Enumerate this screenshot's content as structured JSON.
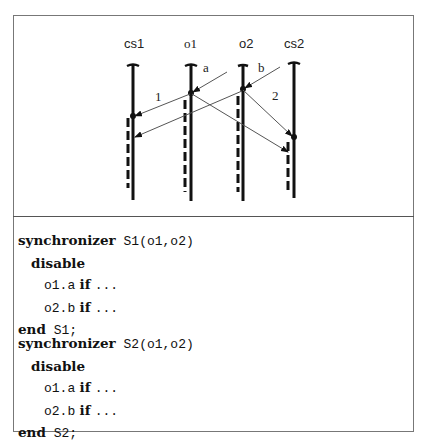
{
  "diagram": {
    "processes": [
      {
        "id": "cs1",
        "label": "cs1"
      },
      {
        "id": "o1",
        "label": "o1"
      },
      {
        "id": "o2",
        "label": "o2"
      },
      {
        "id": "cs2",
        "label": "cs2"
      }
    ],
    "message_labels": {
      "a": "a",
      "b": "b",
      "m1": "1",
      "m2": "2"
    }
  },
  "code": {
    "blocks": [
      {
        "header_kw": "synchronizer",
        "header_sig": " S1(o1,o2)",
        "disable_kw": "disable",
        "rules": [
          {
            "target": "o1.a",
            "kw": "if",
            "cond": "..."
          },
          {
            "target": "o2.b",
            "kw": "if",
            "cond": "..."
          }
        ],
        "end_kw": "end",
        "end_name": " S1;"
      },
      {
        "header_kw": "synchronizer",
        "header_sig": " S2(o1,o2)",
        "disable_kw": "disable",
        "rules": [
          {
            "target": "o1.a",
            "kw": "if",
            "cond": "..."
          },
          {
            "target": "o2.b",
            "kw": "if",
            "cond": "..."
          }
        ],
        "end_kw": "end",
        "end_name": " S2;"
      }
    ]
  }
}
